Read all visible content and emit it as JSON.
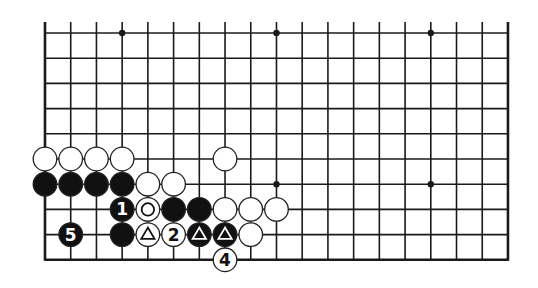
{
  "diagram": {
    "type": "go-board-fragment",
    "board_size": 19,
    "visible": {
      "columns": 19,
      "rows": 10,
      "top_edge_visible": false,
      "bottom_edge_visible": true,
      "left_edge_visible": true,
      "right_edge_visible": true
    },
    "colors": {
      "line": "#1a1a1a",
      "black_stone": "#111111",
      "white_stone": "#ffffff",
      "background": "#ffffff"
    },
    "star_points": [
      {
        "col": 3,
        "row": 0
      },
      {
        "col": 9,
        "row": 0
      },
      {
        "col": 15,
        "row": 0
      },
      {
        "col": 9,
        "row": 6
      },
      {
        "col": 15,
        "row": 6
      }
    ],
    "stones": [
      {
        "color": "white",
        "col": 0,
        "row": 5,
        "label": ""
      },
      {
        "color": "white",
        "col": 1,
        "row": 5,
        "label": ""
      },
      {
        "color": "white",
        "col": 2,
        "row": 5,
        "label": ""
      },
      {
        "color": "white",
        "col": 3,
        "row": 5,
        "label": ""
      },
      {
        "color": "white",
        "col": 7,
        "row": 5,
        "label": ""
      },
      {
        "color": "black",
        "col": 0,
        "row": 6,
        "label": ""
      },
      {
        "color": "black",
        "col": 1,
        "row": 6,
        "label": ""
      },
      {
        "color": "black",
        "col": 2,
        "row": 6,
        "label": ""
      },
      {
        "color": "black",
        "col": 3,
        "row": 6,
        "label": ""
      },
      {
        "color": "white",
        "col": 4,
        "row": 6,
        "label": ""
      },
      {
        "color": "white",
        "col": 5,
        "row": 6,
        "label": ""
      },
      {
        "color": "black",
        "col": 3,
        "row": 7,
        "label": "1"
      },
      {
        "color": "white",
        "col": 4,
        "row": 7,
        "label": "",
        "mark": "circle"
      },
      {
        "color": "black",
        "col": 5,
        "row": 7,
        "label": ""
      },
      {
        "color": "black",
        "col": 6,
        "row": 7,
        "label": ""
      },
      {
        "color": "white",
        "col": 7,
        "row": 7,
        "label": ""
      },
      {
        "color": "white",
        "col": 8,
        "row": 7,
        "label": ""
      },
      {
        "color": "white",
        "col": 9,
        "row": 7,
        "label": ""
      },
      {
        "color": "black",
        "col": 1,
        "row": 8,
        "label": "5"
      },
      {
        "color": "black",
        "col": 3,
        "row": 8,
        "label": ""
      },
      {
        "color": "white",
        "col": 4,
        "row": 8,
        "label": "",
        "mark": "triangle"
      },
      {
        "color": "white",
        "col": 5,
        "row": 8,
        "label": "2"
      },
      {
        "color": "black",
        "col": 6,
        "row": 8,
        "label": "",
        "mark": "triangle"
      },
      {
        "color": "black",
        "col": 7,
        "row": 8,
        "label": "",
        "mark": "triangle"
      },
      {
        "color": "white",
        "col": 8,
        "row": 8,
        "label": ""
      },
      {
        "color": "white",
        "col": 7,
        "row": 9,
        "label": "4"
      }
    ],
    "move_sequence": [
      {
        "number": "1",
        "color": "black"
      },
      {
        "number": "2",
        "color": "white"
      },
      {
        "number": "4",
        "color": "white"
      },
      {
        "number": "5",
        "color": "black"
      }
    ]
  }
}
